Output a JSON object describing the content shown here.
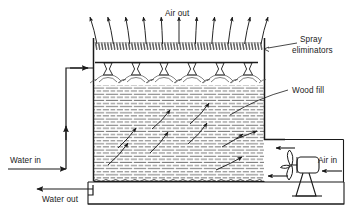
{
  "diagram": {
    "type": "process-schematic",
    "background_color": "#ffffff",
    "line_color": "#1a1a1a",
    "texture_color": "#555555",
    "labels": {
      "air_out": "Air out",
      "spray_eliminators": "Spray\neliminators",
      "spray_eliminators_line1": "Spray",
      "spray_eliminators_line2": "eliminators",
      "wood_fill": "Wood fill",
      "water_in": "Water in",
      "water_out": "Water out",
      "air_in": "Air in"
    },
    "components": [
      {
        "name": "tower-shell",
        "description": "Rectangular tower casing",
        "x": 93,
        "y": 38,
        "width": 172,
        "height": 142
      },
      {
        "name": "spray-eliminator-band",
        "description": "Zigzag drift eliminator layer at top of tower",
        "y": 42,
        "height": 8,
        "zigzag_count": 56
      },
      {
        "name": "distribution-header",
        "description": "Horizontal water distribution pipe feeding nozzles",
        "y": 62,
        "nozzle_count": 6
      },
      {
        "name": "wood-fill-pack",
        "description": "Dashed brick-like fill packing region",
        "y_top": 85,
        "y_bottom": 176,
        "row_spacing": 3.1
      },
      {
        "name": "water-basin",
        "description": "Collection basin below the fill",
        "y": 182,
        "height": 22
      },
      {
        "name": "fan-assembly",
        "description": "Propeller fan with motor and pedestal at right",
        "hub_x": 303,
        "hub_y": 166,
        "blade_count": 3
      }
    ],
    "air_out_arrows": {
      "count": 11,
      "y_tail": 44,
      "y_tip": 17,
      "x_start": 97,
      "x_end": 261
    },
    "internal_air_arrows": {
      "count": 9,
      "description": "Curved arrows showing air crossing the fill upward and to the left"
    },
    "air_in_arrows": {
      "count": 3,
      "direction": "leftward into tower"
    },
    "flows": [
      {
        "name": "water-in",
        "direction": "right-then-up-then-right",
        "terminus": "spray header"
      },
      {
        "name": "water-out",
        "direction": "left",
        "origin": "basin"
      },
      {
        "name": "air-in",
        "direction": "left",
        "origin": "fan"
      },
      {
        "name": "air-out",
        "direction": "up",
        "origin": "tower top"
      }
    ]
  }
}
